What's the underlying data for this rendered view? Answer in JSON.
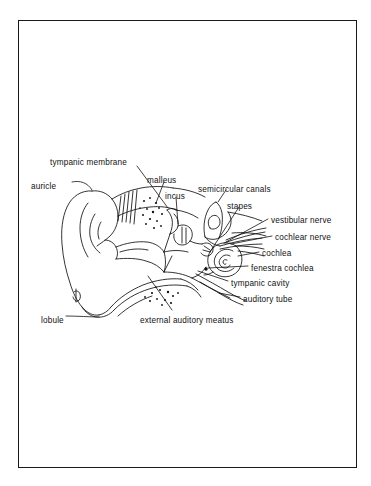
{
  "figure": {
    "border_color": "#1a1a1a",
    "background_color": "#ffffff",
    "ink_color": "#111111"
  },
  "labels": [
    {
      "id": "tympanic-membrane",
      "text": "tympanic membrane",
      "x": 50,
      "y": 159
    },
    {
      "id": "auricle",
      "text": "auricle",
      "x": 31,
      "y": 183
    },
    {
      "id": "malleus",
      "text": "malleus",
      "x": 147,
      "y": 177
    },
    {
      "id": "incus",
      "text": "incus",
      "x": 165,
      "y": 193
    },
    {
      "id": "semicircular-canals",
      "text": "semicircular canals",
      "x": 198,
      "y": 186
    },
    {
      "id": "stapes",
      "text": "stapes",
      "x": 227,
      "y": 203
    },
    {
      "id": "vestibular-nerve",
      "text": "vestibular nerve",
      "x": 271,
      "y": 217
    },
    {
      "id": "cochlear-nerve",
      "text": "cochlear nerve",
      "x": 275,
      "y": 234
    },
    {
      "id": "cochlea",
      "text": "cochlea",
      "x": 262,
      "y": 250
    },
    {
      "id": "fenestra-cochlea",
      "text": "fenestra cochlea",
      "x": 251,
      "y": 265
    },
    {
      "id": "tympanic-cavity",
      "text": "tympanic cavity",
      "x": 231,
      "y": 280
    },
    {
      "id": "auditory-tube",
      "text": "auditory tube",
      "x": 243,
      "y": 296
    },
    {
      "id": "lobule",
      "text": "lobule",
      "x": 41,
      "y": 317
    },
    {
      "id": "external-auditory-meatus",
      "text": "external auditory meatus",
      "x": 140,
      "y": 317
    }
  ],
  "structures": [
    "auricle",
    "lobule",
    "external auditory meatus",
    "tympanic membrane",
    "malleus",
    "incus",
    "stapes",
    "tympanic cavity",
    "auditory tube",
    "semicircular canals",
    "vestibular nerve",
    "cochlear nerve",
    "cochlea",
    "fenestra cochlea"
  ]
}
